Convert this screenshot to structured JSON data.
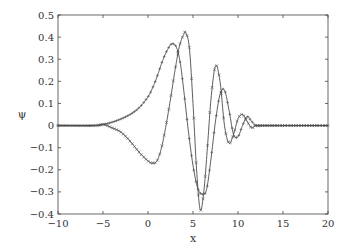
{
  "chart_data": {
    "type": "line",
    "title": "",
    "xlabel": "x",
    "ylabel": "ψ",
    "xlim": [
      -10,
      20
    ],
    "ylim": [
      -0.4,
      0.5
    ],
    "xticks": [
      -10,
      -5,
      0,
      5,
      10,
      15,
      20
    ],
    "xtick_labels": [
      "−10",
      "−5",
      "0",
      "5",
      "10",
      "15",
      "20"
    ],
    "yticks": [
      -0.4,
      -0.3,
      -0.2,
      -0.1,
      0,
      0.1,
      0.2,
      0.3,
      0.4,
      0.5
    ],
    "ytick_labels": [
      "−0.4",
      "−0.3",
      "−0.2",
      "−0.1",
      "0",
      "0.1",
      "0.2",
      "0.3",
      "0.4",
      "0.5"
    ],
    "grid": false,
    "legend": null,
    "series": [
      {
        "name": "curve-x-markers",
        "marker": "x",
        "x": [
          -10,
          -6,
          -5,
          -4,
          -3,
          -2,
          -1,
          0,
          0.5,
          1,
          1.5,
          2,
          2.5,
          3,
          3.5,
          4,
          4.2,
          4.6,
          5,
          5.4,
          5.8,
          6.2,
          6.6,
          7,
          7.5,
          8,
          8.5,
          9,
          9.5,
          10,
          10.5,
          11,
          11.5,
          12,
          13,
          15,
          20
        ],
        "y": [
          0,
          0,
          0.005,
          -0.01,
          -0.03,
          -0.07,
          -0.12,
          -0.16,
          -0.17,
          -0.16,
          -0.1,
          0,
          0.12,
          0.25,
          0.36,
          0.415,
          0.42,
          0.35,
          0.1,
          -0.2,
          -0.38,
          -0.3,
          -0.1,
          0.12,
          0.27,
          0.2,
          0.0,
          -0.08,
          -0.04,
          0.03,
          0.05,
          0.02,
          -0.01,
          0,
          0,
          0,
          0
        ]
      },
      {
        "name": "curve-plus-markers",
        "marker": "+",
        "x": [
          -10,
          -6,
          -5,
          -4,
          -3,
          -2,
          -1,
          0,
          0.5,
          1,
          1.5,
          2,
          2.5,
          2.8,
          3.2,
          3.6,
          4,
          4.5,
          5,
          5.5,
          6,
          6.5,
          7,
          7.5,
          8,
          8.5,
          9,
          9.5,
          10,
          10.5,
          11,
          11.5,
          12,
          13,
          15,
          20
        ],
        "y": [
          0,
          0,
          0.005,
          0.015,
          0.03,
          0.05,
          0.08,
          0.13,
          0.17,
          0.22,
          0.28,
          0.33,
          0.365,
          0.37,
          0.35,
          0.28,
          0.15,
          -0.03,
          -0.18,
          -0.28,
          -0.31,
          -0.29,
          -0.15,
          0.02,
          0.14,
          0.16,
          0.07,
          -0.04,
          -0.05,
          0.0,
          0.04,
          0.02,
          0,
          0,
          0,
          0
        ]
      }
    ]
  }
}
